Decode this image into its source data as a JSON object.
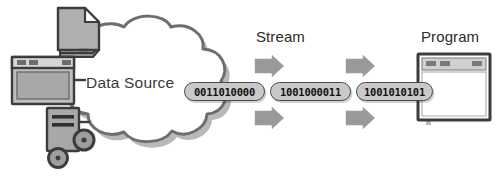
{
  "diagram": {
    "background_color": "#ffffff",
    "labels": {
      "data_source": "Data Source",
      "stream": "Stream",
      "program": "Program"
    },
    "stream_packets": [
      "0011010000",
      "1001000011",
      "1001010101"
    ],
    "arrows": {
      "count": 4,
      "direction": "right",
      "positions": [
        "top-left",
        "bottom-left",
        "top-right",
        "bottom-right"
      ]
    },
    "source_icons": [
      {
        "name": "document-icon",
        "label": "document"
      },
      {
        "name": "monitor-window-icon",
        "label": "monitor"
      },
      {
        "name": "server-gears-icon",
        "label": "server"
      }
    ],
    "program_window": {
      "title_bar_buttons": 3
    },
    "colors": {
      "cloud_fill": "#ffffff",
      "cloud_stroke": "#6e6e6e",
      "cloud_shadow": "#b8b8b8",
      "icon_fill": "#a8a8a8",
      "icon_stroke": "#3c3c3c",
      "capsule_fill": "#c9c9c9",
      "capsule_stroke": "#4a4a4a",
      "arrow_fill": "#9a9a9a",
      "arrow_stroke": "#ffffff",
      "text": "#2b2b2b"
    }
  }
}
